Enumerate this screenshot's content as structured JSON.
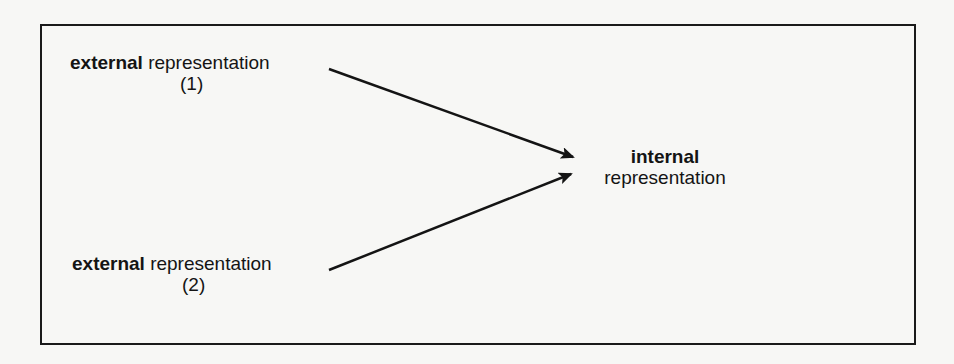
{
  "diagram": {
    "nodes": [
      {
        "id": "ext1",
        "bold": "external",
        "text": "representation",
        "sub": "(1)"
      },
      {
        "id": "ext2",
        "bold": "external",
        "text": "representation",
        "sub": "(2)"
      },
      {
        "id": "int",
        "bold": "internal",
        "text": "representation"
      }
    ],
    "edges": [
      {
        "from": "ext1",
        "to": "int"
      },
      {
        "from": "ext2",
        "to": "int"
      }
    ]
  }
}
